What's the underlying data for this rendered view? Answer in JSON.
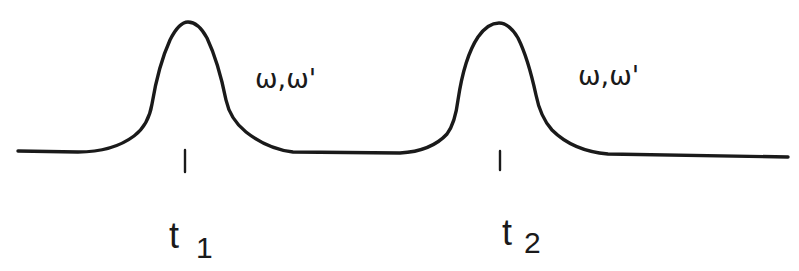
{
  "diagram": {
    "pulses": [
      {
        "id": "pulse-1",
        "label": "ω,ω'",
        "time_label": "t",
        "time_subscript": "1",
        "center_x": 187
      },
      {
        "id": "pulse-2",
        "label": "ω,ω'",
        "time_label": "t",
        "time_subscript": "2",
        "center_x": 498
      }
    ],
    "colors": {
      "stroke": "#1a1a1a",
      "background": "#ffffff"
    }
  }
}
